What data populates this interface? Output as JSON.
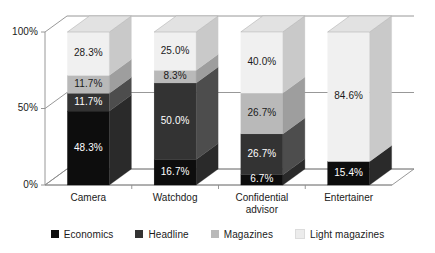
{
  "chart_data": {
    "type": "bar",
    "subtype": "stacked-percentage-3d",
    "title": "",
    "xlabel": "",
    "ylabel": "",
    "ylim": [
      0,
      100
    ],
    "yticks": [
      "0%",
      "50%",
      "100%"
    ],
    "ytick_values": [
      0,
      50,
      100
    ],
    "grid": true,
    "grid_axis": "y",
    "legend_position": "bottom",
    "stack_order": "bottom-to-top",
    "value_suffix": "%",
    "categories": [
      "Camera",
      "Watchdog",
      "Confidential advisor",
      "Entertainer"
    ],
    "series": [
      {
        "name": "Economics",
        "color": "#0d0d0d",
        "top_color": "#3d3d3d",
        "side_color": "#2a2a2a",
        "label_color": "on-dark",
        "values": [
          48.3,
          16.7,
          6.7,
          15.4
        ],
        "labels": [
          "48.3%",
          "16.7%",
          "6.7%",
          "15.4%"
        ]
      },
      {
        "name": "Headline",
        "color": "#333333",
        "top_color": "#6a6a6a",
        "side_color": "#4d4d4d",
        "label_color": "on-dark",
        "values": [
          11.7,
          50.0,
          26.7,
          0
        ],
        "labels": [
          "11.7%",
          "50.0%",
          "26.7%",
          ""
        ]
      },
      {
        "name": "Magazines",
        "color": "#b9b9b9",
        "top_color": "#d4d4d4",
        "side_color": "#9e9e9e",
        "label_color": "on-light",
        "values": [
          11.7,
          8.3,
          26.7,
          0
        ],
        "labels": [
          "11.7%",
          "8.3%",
          "26.7%",
          ""
        ]
      },
      {
        "name": "Light magazines",
        "color": "#f0f0f0",
        "top_color": "#e2e2e2",
        "side_color": "#c9c9c9",
        "label_color": "on-light",
        "values": [
          28.3,
          25.0,
          40.0,
          84.6
        ],
        "labels": [
          "28.3%",
          "25.0%",
          "40.0%",
          "84.6%"
        ]
      }
    ]
  },
  "axis": {
    "y_ticks": [
      "100%",
      "50%",
      "0%"
    ]
  },
  "categories_display": [
    "Camera",
    "Watchdog",
    "Confidential\nadvisor",
    "Entertainer"
  ],
  "legend": {
    "items": [
      {
        "label": "Economics",
        "color": "#0d0d0d"
      },
      {
        "label": "Headline",
        "color": "#333333"
      },
      {
        "label": "Magazines",
        "color": "#b9b9b9"
      },
      {
        "label": "Light magazines",
        "color": "#ececec"
      }
    ]
  },
  "colors": {
    "axis_line": "#8c8c8c",
    "grid_line": "#8c8c8c",
    "text": "#1a1a1a",
    "background": "#ffffff"
  }
}
